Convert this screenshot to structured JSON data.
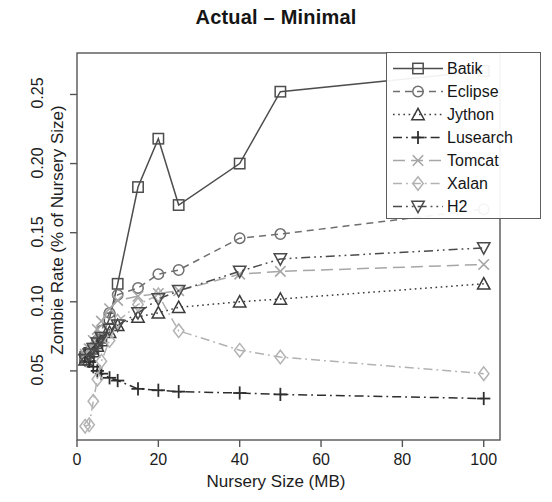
{
  "chart_data": {
    "type": "line",
    "title": "Actual – Minimal",
    "xlabel": "Nursery Size (MB)",
    "ylabel": "Zombie Rate (% of Nursery Size)",
    "xlim": [
      0,
      104
    ],
    "ylim": [
      0,
      0.28
    ],
    "xticks": [
      0,
      20,
      40,
      60,
      80,
      100
    ],
    "xtick_labels": [
      "0",
      "20",
      "40",
      "60",
      "80",
      "100"
    ],
    "yticks": [
      0.05,
      0.1,
      0.15,
      0.2,
      0.25
    ],
    "ytick_labels": [
      "0.05",
      "0.10",
      "0.15",
      "0.20",
      "0.25"
    ],
    "grid": false,
    "legend_position": "top-right",
    "series": [
      {
        "name": "Batik",
        "marker": "square",
        "dash": "solid",
        "color": "#4d4d4d",
        "x": [
          2,
          3,
          4,
          5,
          6,
          8,
          10,
          15,
          20,
          25,
          40,
          50,
          100
        ],
        "y": [
          0.06,
          0.063,
          0.066,
          0.07,
          0.074,
          0.088,
          0.113,
          0.183,
          0.218,
          0.17,
          0.2,
          0.252,
          0.267
        ]
      },
      {
        "name": "Eclipse",
        "marker": "circle",
        "dash": "dashed",
        "color": "#6f6f6f",
        "x": [
          2,
          3,
          4,
          5,
          6,
          8,
          10,
          15,
          20,
          25,
          40,
          50,
          100
        ],
        "y": [
          0.058,
          0.062,
          0.066,
          0.072,
          0.079,
          0.092,
          0.105,
          0.11,
          0.12,
          0.123,
          0.146,
          0.149,
          0.167
        ]
      },
      {
        "name": "Jython",
        "marker": "triangle-up",
        "dash": "dotted",
        "color": "#3b3b3b",
        "x": [
          2,
          3,
          4,
          5,
          6,
          8,
          10,
          15,
          20,
          25,
          40,
          50,
          100
        ],
        "y": [
          0.058,
          0.06,
          0.064,
          0.068,
          0.072,
          0.078,
          0.083,
          0.089,
          0.092,
          0.096,
          0.1,
          0.102,
          0.113
        ]
      },
      {
        "name": "Lusearch",
        "marker": "plus",
        "dash": "dashdot",
        "color": "#2e2e2e",
        "x": [
          2,
          3,
          4,
          5,
          6,
          8,
          10,
          15,
          20,
          25,
          40,
          50,
          100
        ],
        "y": [
          0.062,
          0.057,
          0.053,
          0.05,
          0.048,
          0.045,
          0.043,
          0.037,
          0.036,
          0.035,
          0.034,
          0.033,
          0.03
        ]
      },
      {
        "name": "Tomcat",
        "marker": "cross",
        "dash": "longdash",
        "color": "#a6a6a6",
        "x": [
          2,
          3,
          4,
          5,
          6,
          8,
          10,
          15,
          20,
          25,
          40,
          50,
          100
        ],
        "y": [
          0.062,
          0.066,
          0.072,
          0.08,
          0.086,
          0.095,
          0.101,
          0.104,
          0.106,
          0.108,
          0.12,
          0.122,
          0.127
        ]
      },
      {
        "name": "Xalan",
        "marker": "diamond",
        "dash": "dashdot",
        "color": "#b2b2b2",
        "x": [
          2,
          3,
          4,
          5,
          6,
          8,
          10,
          15,
          20,
          25,
          40,
          50,
          100
        ],
        "y": [
          0.01,
          0.011,
          0.028,
          0.044,
          0.057,
          0.072,
          0.086,
          0.098,
          0.105,
          0.079,
          0.065,
          0.06,
          0.048
        ]
      },
      {
        "name": "H2",
        "marker": "triangle-down",
        "dash": "dashdotdot",
        "color": "#4a4a4a",
        "x": [
          2,
          3,
          4,
          5,
          6,
          8,
          10,
          15,
          20,
          25,
          40,
          50,
          100
        ],
        "y": [
          0.058,
          0.062,
          0.066,
          0.07,
          0.074,
          0.08,
          0.083,
          0.092,
          0.102,
          0.108,
          0.122,
          0.131,
          0.139
        ]
      }
    ]
  },
  "legend": {
    "items": [
      {
        "label": "Batik"
      },
      {
        "label": "Eclipse"
      },
      {
        "label": "Jython"
      },
      {
        "label": "Lusearch"
      },
      {
        "label": "Tomcat"
      },
      {
        "label": "Xalan"
      },
      {
        "label": "H2"
      }
    ]
  }
}
